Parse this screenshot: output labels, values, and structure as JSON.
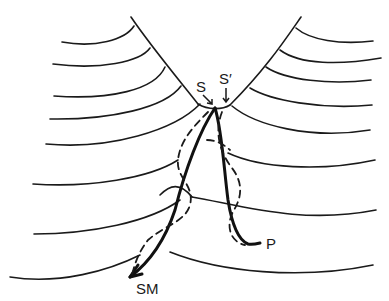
{
  "diagram": {
    "labels": {
      "s": "S",
      "s_prime": "S′",
      "sm": "SM",
      "p": "P"
    },
    "legend_styles": {
      "solid_path": "solid",
      "dashed_path": "dashed"
    },
    "colors": {
      "ink": "#1a1a1a",
      "background": "#ffffff"
    }
  }
}
